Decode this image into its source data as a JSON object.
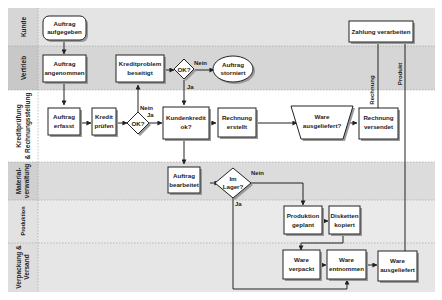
{
  "colors": {
    "lane_dark": "#d9d9d9",
    "lane_light": "#ececec",
    "header_dark": "#cfcfcf",
    "header_light": "#e6e6e6",
    "node_fill": "#ffffff",
    "stroke": "#222222",
    "shadow": "#9a9a9a"
  },
  "lanes": [
    {
      "id": "kunde",
      "label_lines": [
        "Kunde"
      ]
    },
    {
      "id": "vertrieb",
      "label_lines": [
        "Vertrieb"
      ]
    },
    {
      "id": "kredit",
      "label_lines": [
        "Kreditprüfung",
        "& Rechnungsstellung"
      ]
    },
    {
      "id": "material",
      "label_lines": [
        "Material-",
        "verwaltung"
      ]
    },
    {
      "id": "produktion",
      "label_lines": [
        "Produktion"
      ]
    },
    {
      "id": "verpackung",
      "label_lines": [
        "Verpackung &",
        "Versand"
      ]
    }
  ],
  "nodes": {
    "auftrag_aufgegeben": {
      "lines": [
        "Auftrag",
        "aufgegeben"
      ]
    },
    "auftrag_angenommen": {
      "lines": [
        "Auftrag",
        "angenommen"
      ]
    },
    "kreditproblem": {
      "lines": [
        "Kreditproblem",
        "beseitigt"
      ]
    },
    "ok1": {
      "lines": [
        "OK?"
      ]
    },
    "auftrag_storniert": {
      "lines": [
        "Auftrag",
        "storniert"
      ]
    },
    "zahlung": {
      "lines": [
        "Zahlung verarbeiten"
      ]
    },
    "auftrag_erfasst": {
      "lines": [
        "Auftrag",
        "erfasst"
      ]
    },
    "kredit_pruefen": {
      "lines": [
        "Kredit",
        "prüfen"
      ]
    },
    "ok2": {
      "lines": [
        "OK?"
      ]
    },
    "kundenkredit": {
      "lines": [
        "Kundenkredit",
        "ok?"
      ]
    },
    "rechnung_erstellt": {
      "lines": [
        "Rechnung",
        "erstellt"
      ]
    },
    "ware_ausgeliefert_q": {
      "lines": [
        "Ware",
        "ausgeliefert?"
      ]
    },
    "rechnung_versendet": {
      "lines": [
        "Rechnung",
        "versendet"
      ]
    },
    "auftrag_bearbeitet": {
      "lines": [
        "Auftrag",
        "bearbeitet"
      ]
    },
    "im_lager": {
      "lines": [
        "Im",
        "Lager?"
      ]
    },
    "produktion_geplant": {
      "lines": [
        "Produktion",
        "geplant"
      ]
    },
    "disketten_kopiert": {
      "lines": [
        "Disketten",
        "kopiert"
      ]
    },
    "ware_verpackt": {
      "lines": [
        "Ware",
        "verpackt"
      ]
    },
    "ware_entnommen": {
      "lines": [
        "Ware",
        "entnommen"
      ]
    },
    "ware_ausgeliefert": {
      "lines": [
        "Ware",
        "ausgeliefert"
      ]
    }
  },
  "edge_labels": {
    "ok1_nein": "Nein",
    "ok1_ja": "Ja",
    "ok2_nein": "Nein",
    "ok2_ja": "Ja",
    "lager_nein": "Nein",
    "lager_ja": "Ja",
    "rechnung": "Rechnung",
    "produkt": "Produkt"
  }
}
